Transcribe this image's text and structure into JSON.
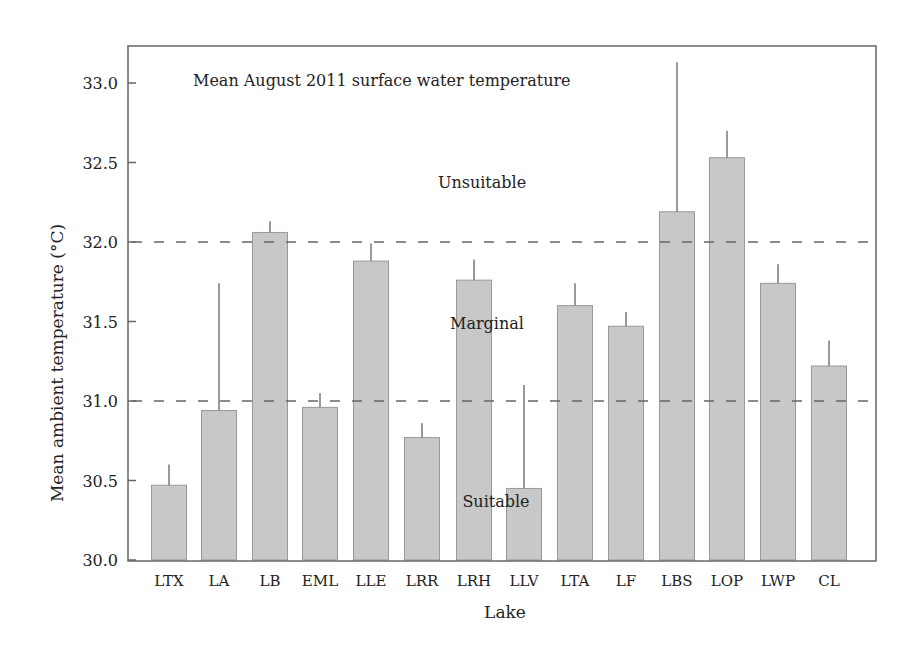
{
  "chart_data": {
    "type": "bar",
    "title": "Mean August 2011 surface water temperature",
    "xlabel": "Lake",
    "ylabel": "Mean ambient temperature (°C)",
    "ylim": [
      30.0,
      33.25
    ],
    "yticks": [
      "30.0",
      "30.5",
      "31.0",
      "31.5",
      "32.0",
      "32.5",
      "33.0"
    ],
    "grid": false,
    "categories": [
      "LTX",
      "LA",
      "LB",
      "EML",
      "LLE",
      "LRR",
      "LRH",
      "LLV",
      "LTA",
      "LF",
      "LBS",
      "LOP",
      "LWP",
      "CL"
    ],
    "values": [
      30.47,
      30.94,
      32.06,
      30.96,
      31.88,
      30.77,
      31.76,
      30.45,
      31.6,
      31.47,
      32.19,
      32.53,
      31.74,
      31.22
    ],
    "error_upper": [
      30.6,
      31.74,
      32.13,
      31.05,
      31.99,
      30.86,
      31.89,
      31.1,
      31.74,
      31.56,
      33.13,
      32.7,
      31.86,
      31.38
    ],
    "thresholds": [
      {
        "value": 32.0,
        "style": "dashed"
      },
      {
        "value": 31.0,
        "style": "dashed"
      }
    ],
    "annotations": [
      {
        "text": "Unsuitable",
        "x_center": 482,
        "y": 182
      },
      {
        "text": "Marginal",
        "x_center": 487,
        "y": 323
      },
      {
        "text": "Suitable",
        "x_center": 496,
        "y": 501
      }
    ]
  }
}
